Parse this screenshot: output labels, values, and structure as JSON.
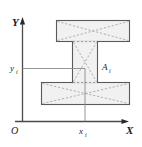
{
  "figure": {
    "kind": "cross-section-diagram",
    "caption": ""
  },
  "axes": {
    "x_axis_label": "X",
    "y_axis_label": "Y",
    "origin_label": "O",
    "x_tick_label": "x",
    "x_tick_subscript": "i",
    "y_tick_label": "y",
    "y_tick_subscript": "i",
    "axis_color": "#4a4a4a",
    "projection_line_color": "#8a8a8a"
  },
  "shape": {
    "area_label": "A",
    "area_subscript": "i",
    "fill_color": "#f0f0f0",
    "stroke_color": "#5a5a5a",
    "diagonal_color": "#9a9a9a",
    "parts": [
      {
        "name": "top-flange",
        "x": 56,
        "y": 20,
        "width": 74,
        "height": 22
      },
      {
        "name": "web",
        "x": 72,
        "y": 42,
        "width": 26,
        "height": 40
      },
      {
        "name": "bottom-flange",
        "x": 41,
        "y": 82,
        "width": 89,
        "height": 23
      }
    ]
  },
  "centroid": {
    "name": "centroid-marker",
    "x": 85,
    "y": 68
  }
}
